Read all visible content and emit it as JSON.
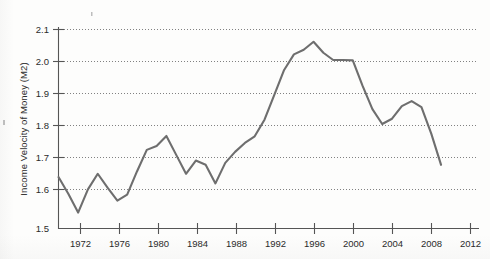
{
  "figure": {
    "background_color": "#fdfdfc",
    "line_color": "#6e6e6e",
    "axis_color": "#555555",
    "grid_color": "#5a5a5a"
  },
  "chart_data": {
    "type": "line",
    "title": "",
    "xlabel": "",
    "ylabel": "Income Velocity of Money (M2)",
    "xlim": [
      1970,
      2013
    ],
    "ylim": [
      1.5,
      2.13
    ],
    "grid": true,
    "grid_axis": "y",
    "legend": "none",
    "xticks": [
      1972,
      1976,
      1980,
      1984,
      1988,
      1992,
      1996,
      2000,
      2004,
      2008,
      2012
    ],
    "xtick_labels": [
      "1972",
      "1976",
      "1980",
      "1984",
      "1988",
      "1992",
      "1996",
      "2000",
      "2004",
      "2008",
      "2012"
    ],
    "yticks": [
      1.5,
      1.6,
      1.7,
      1.8,
      1.9,
      2.0,
      2.1
    ],
    "ytick_labels": [
      "1.5",
      "1.6",
      "1.7",
      "1.8",
      "1.9",
      "2.0",
      "2.1"
    ],
    "series": [
      {
        "name": "Income Velocity of Money (M2)",
        "color": "#6e6e6e",
        "x": [
          1970,
          1971,
          1972,
          1973,
          1974,
          1975,
          1976,
          1977,
          1978,
          1979,
          1980,
          1981,
          1982,
          1983,
          1984,
          1985,
          1986,
          1987,
          1988,
          1989,
          1990,
          1991,
          1992,
          1993,
          1994,
          1995,
          1996,
          1997,
          1998,
          1999,
          2000,
          2001,
          2002,
          2003,
          2004,
          2005,
          2006,
          2007,
          2008,
          2009
        ],
        "y": [
          1.655,
          1.605,
          1.548,
          1.618,
          1.665,
          1.623,
          1.584,
          1.602,
          1.672,
          1.737,
          1.749,
          1.779,
          1.722,
          1.665,
          1.705,
          1.692,
          1.636,
          1.698,
          1.731,
          1.758,
          1.778,
          1.828,
          1.903,
          1.978,
          2.025,
          2.039,
          2.063,
          2.03,
          2.008,
          2.008,
          2.007,
          1.93,
          1.86,
          1.815,
          1.831,
          1.869,
          1.884,
          1.866,
          1.786,
          1.692
        ]
      }
    ]
  },
  "axis": {
    "y_title": "Income Velocity of Money (M2)"
  }
}
